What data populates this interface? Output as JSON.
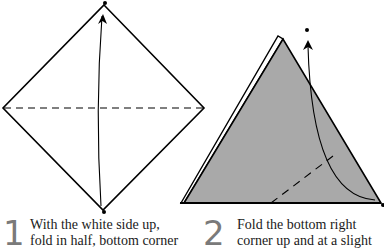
{
  "steps": [
    {
      "number": "1",
      "lines": [
        "With the white side up,",
        "fold in half, bottom corner"
      ]
    },
    {
      "number": "2",
      "lines": [
        "Fold the bottom right",
        "corner up and at a slight"
      ]
    }
  ],
  "colors": {
    "paper_white": "#ffffff",
    "paper_colored": "#a9a9a9",
    "line": "#000000",
    "step_number": "#7a7a7a"
  }
}
